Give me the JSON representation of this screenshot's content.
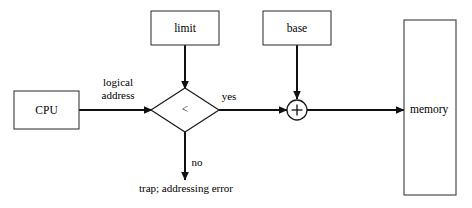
{
  "diagram": {
    "background_color": "#ffffff",
    "stroke_color": "#111111",
    "box_stroke_color": "#3b3b3b",
    "nodes": {
      "cpu": {
        "label": "CPU",
        "shape": "rectangle"
      },
      "limit": {
        "label": "limit",
        "shape": "rectangle"
      },
      "base": {
        "label": "base",
        "shape": "rectangle"
      },
      "compare": {
        "label": "<",
        "shape": "diamond"
      },
      "adder": {
        "label": "+",
        "shape": "circle"
      },
      "memory": {
        "label": "memory",
        "shape": "rectangle"
      }
    },
    "edge_labels": {
      "logical_address_line1": "logical",
      "logical_address_line2": "address",
      "yes": "yes",
      "no": "no"
    },
    "terminals": {
      "trap": "trap; addressing error"
    }
  }
}
